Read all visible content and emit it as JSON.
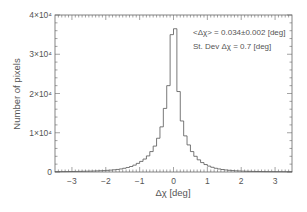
{
  "chart_data": {
    "type": "bar",
    "subtype": "histogram-step",
    "title": "",
    "xlabel": "Δχ [deg]",
    "ylabel": "Number of pixels",
    "xlim": [
      -3.5,
      3.5
    ],
    "ylim": [
      0,
      40000
    ],
    "x_ticks": [
      -3,
      -2,
      -1,
      0,
      1,
      2,
      3
    ],
    "x_tick_labels": [
      "−3",
      "−2",
      "−1",
      "0",
      "1",
      "2",
      "3"
    ],
    "y_ticks": [
      0,
      10000,
      20000,
      30000,
      40000
    ],
    "y_tick_labels": [
      "0",
      "1×10⁴",
      "2×10⁴",
      "3×10⁴",
      "4×10⁴"
    ],
    "bin_width": 0.1,
    "bin_centers": [
      -3.45,
      -3.35,
      -3.25,
      -3.15,
      -3.05,
      -2.95,
      -2.85,
      -2.75,
      -2.65,
      -2.55,
      -2.45,
      -2.35,
      -2.25,
      -2.15,
      -2.05,
      -1.95,
      -1.85,
      -1.75,
      -1.65,
      -1.55,
      -1.45,
      -1.35,
      -1.25,
      -1.15,
      -1.05,
      -0.95,
      -0.85,
      -0.75,
      -0.65,
      -0.55,
      -0.45,
      -0.35,
      -0.25,
      -0.15,
      -0.05,
      0.05,
      0.15,
      0.25,
      0.35,
      0.45,
      0.55,
      0.65,
      0.75,
      0.85,
      0.95,
      1.05,
      1.15,
      1.25,
      1.35,
      1.45,
      1.55,
      1.65,
      1.75,
      1.85,
      1.95,
      2.05,
      2.15,
      2.25,
      2.35,
      2.45,
      2.55,
      2.65,
      2.75,
      2.85,
      2.95,
      3.05,
      3.15,
      3.25,
      3.35,
      3.45
    ],
    "values": [
      80,
      90,
      100,
      110,
      120,
      130,
      140,
      160,
      180,
      200,
      220,
      250,
      280,
      320,
      360,
      420,
      480,
      560,
      650,
      780,
      950,
      1150,
      1400,
      1750,
      2200,
      2700,
      3300,
      4100,
      5200,
      6600,
      8600,
      11500,
      16200,
      22000,
      35000,
      36500,
      20500,
      13000,
      9200,
      6900,
      5200,
      4000,
      3100,
      2400,
      1900,
      1500,
      1200,
      950,
      780,
      640,
      520,
      430,
      360,
      300,
      260,
      220,
      190,
      170,
      150,
      135,
      120,
      110,
      100,
      95,
      90,
      85,
      80,
      75,
      70,
      65
    ],
    "grid": false,
    "legend": null,
    "annotations": [
      "<Δχ> = 0.034±0.002 [deg]",
      "St. Dev Δχ = 0.7 [deg]"
    ]
  },
  "annotations": {
    "mean": "<Δχ> = 0.034±0.002 [deg]",
    "stdev": "St. Dev Δχ = 0.7 [deg]"
  },
  "axes": {
    "xlabel": "Δχ [deg]",
    "ylabel": "Number of pixels"
  },
  "colors": {
    "line": "#555555",
    "frame": "#555555",
    "text": "#555555"
  }
}
